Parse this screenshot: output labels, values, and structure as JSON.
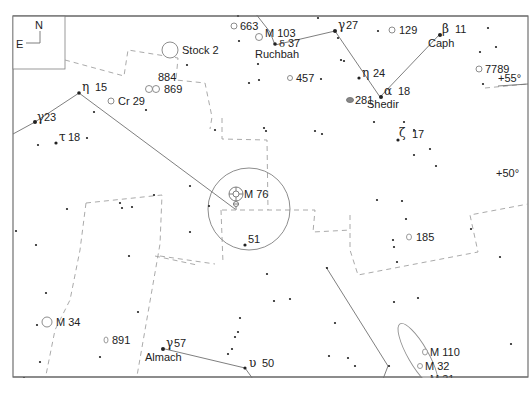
{
  "compass": {
    "north": "N",
    "east": "E"
  },
  "grid_labels": {
    "dec_55": "+55°",
    "dec_50": "+50°",
    "ra_2h": "2h",
    "ra_1h": "1h"
  },
  "stars": {
    "eta_cas": {
      "greek": "η",
      "num": "24"
    },
    "alpha_cas": {
      "greek": "α",
      "num": "18",
      "name": "Shedir"
    },
    "beta_cas": {
      "greek": "β",
      "num": "11",
      "name": "Caph"
    },
    "gamma_cas": {
      "greek": "γ",
      "num": "27"
    },
    "delta_cas": {
      "greek": "δ",
      "num": "37",
      "name": "Ruchbah"
    },
    "zeta_cas": {
      "greek": "ζ",
      "num": "17"
    },
    "eta_per": {
      "greek": "η",
      "num": "15"
    },
    "gamma_per": {
      "greek": "γ",
      "num": "23"
    },
    "tau_per": {
      "greek": "τ",
      "num": "18"
    },
    "phi_per_51": {
      "num": "51"
    },
    "gamma_and": {
      "greek": "γ",
      "num": "57",
      "name": "Almach"
    },
    "upsilon_and": {
      "greek": "υ",
      "num": "50"
    }
  },
  "deep_sky": {
    "stock2": "Stock 2",
    "ngc884": "884",
    "ngc869": "869",
    "cr29": "Cr 29",
    "ngc663": "663",
    "m103": "M 103",
    "ngc457": "457",
    "ngc129": "129",
    "ngc7789": "7789",
    "ngc281": "281",
    "ngc185": "185",
    "m76": "M 76",
    "m34": "M 34",
    "ngc891": "891",
    "ngc1023": "1023",
    "m110": "M 110",
    "m32": "M 32",
    "m31": "M 31"
  }
}
